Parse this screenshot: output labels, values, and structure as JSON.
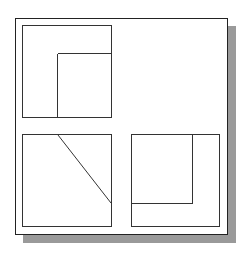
{
  "diagram": {
    "views": [
      {
        "name": "top-left-view",
        "x": 22,
        "y": 25,
        "w": 89,
        "h": 93,
        "lines": [
          [
            57,
            53,
            111,
            53
          ],
          [
            57,
            53,
            57,
            118
          ]
        ]
      },
      {
        "name": "bottom-left-view",
        "x": 22,
        "y": 134,
        "w": 89,
        "h": 93,
        "lines": [
          [
            58,
            134,
            111,
            203
          ]
        ]
      },
      {
        "name": "bottom-right-view",
        "x": 131,
        "y": 134,
        "w": 88,
        "h": 93,
        "lines": [
          [
            131,
            203,
            192,
            203
          ],
          [
            192,
            134,
            192,
            203
          ]
        ]
      }
    ],
    "colors": {
      "line": "#333333",
      "shadow": "#9a9a9a",
      "frame": "#222222"
    }
  }
}
